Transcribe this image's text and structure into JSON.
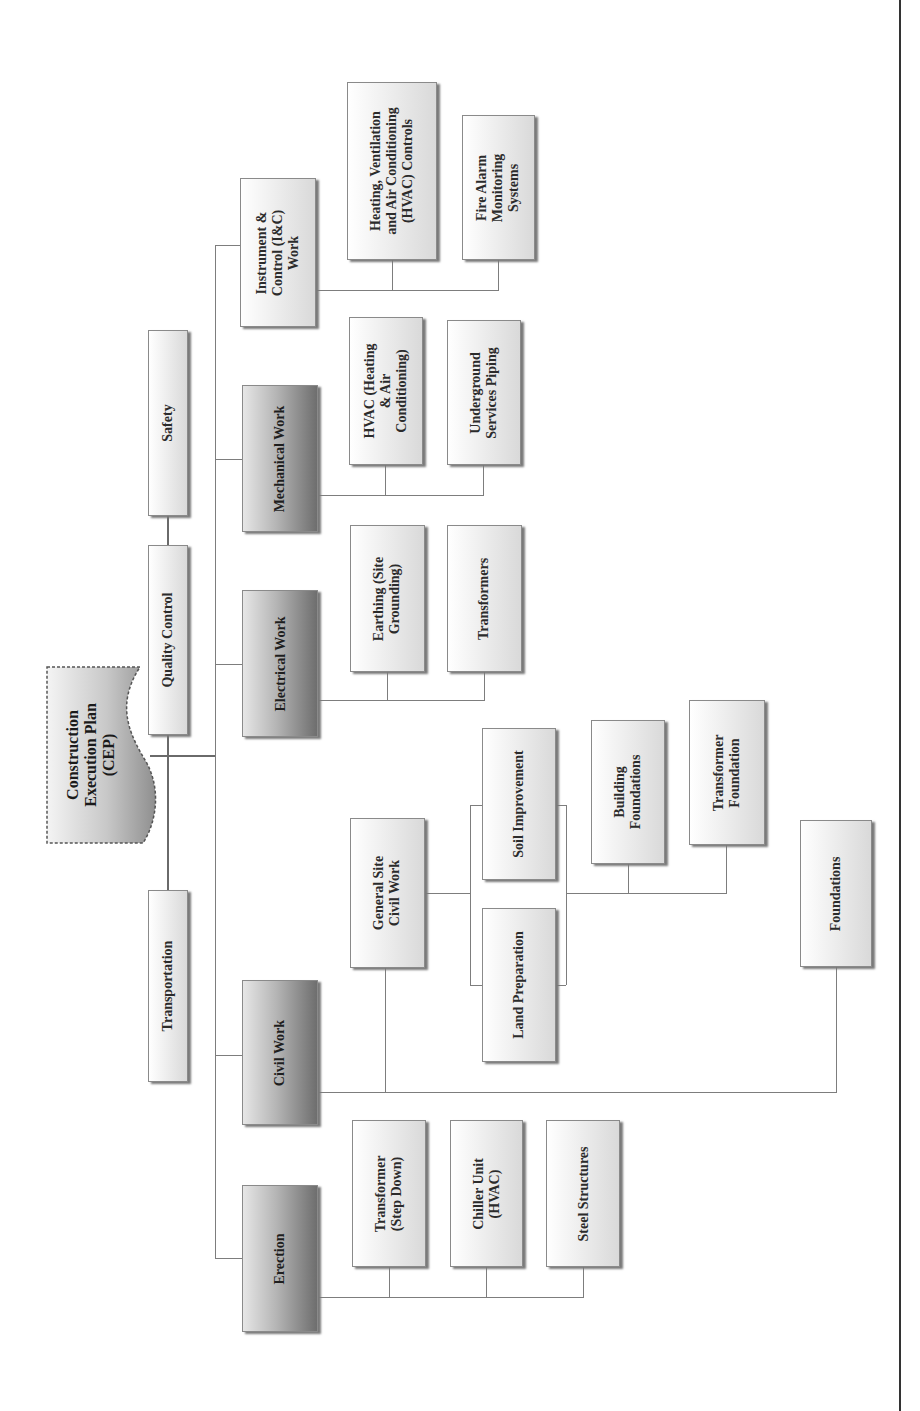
{
  "diagram": {
    "title": "Construction Execution Plan (CEP)",
    "orientation": "rotated -90deg (reads bottom-to-top)",
    "root": {
      "label": "Construction\nExecution Plan\n(CEP)"
    },
    "support_nodes": [
      {
        "label": "Safety"
      },
      {
        "label": "Quality Control"
      },
      {
        "label": "Transportation"
      }
    ],
    "work_packages": [
      {
        "label": "Instrument &\nControl (I&C)\nWork",
        "children": [
          {
            "label": "Heating, Ventilation\nand Air Conditioning\n(HVAC) Controls"
          },
          {
            "label": "Fire Alarm\nMonitoring\nSystems"
          }
        ]
      },
      {
        "label": "Mechanical Work",
        "children": [
          {
            "label": "HVAC (Heating\n& Air\nConditioning)"
          },
          {
            "label": "Underground\nServices Piping"
          }
        ]
      },
      {
        "label": "Electrical Work",
        "children": [
          {
            "label": "Earthing (Site\nGrounding)"
          },
          {
            "label": "Transformers"
          }
        ]
      },
      {
        "label": "Civil Work",
        "children": [
          {
            "label": "General Site\nCivil Work",
            "children": [
              {
                "label": "Soil Improvement"
              },
              {
                "label": "Land Preparation"
              },
              {
                "label": "Building\nFoundations"
              },
              {
                "label": "Transformer\nFoundation"
              }
            ]
          },
          {
            "label": "Foundations"
          }
        ]
      },
      {
        "label": "Erection",
        "children": [
          {
            "label": "Transformer\n(Step Down)"
          },
          {
            "label": "Chiller Unit\n(HVAC)"
          },
          {
            "label": "Steel Structures"
          }
        ]
      }
    ]
  },
  "colors": {
    "line": "#7d7d7d",
    "box_light_start": "#ffffff",
    "box_light_end": "#d9d9d9",
    "box_dark_end": "#6e6e6e",
    "text": "#2b2b2b"
  }
}
